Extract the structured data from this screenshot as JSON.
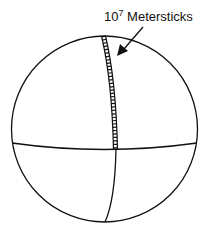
{
  "diagram": {
    "label": {
      "base": "10",
      "exponent": "7",
      "text": " Metersticks"
    },
    "colors": {
      "stroke": "#111111",
      "background": "#ffffff"
    }
  }
}
